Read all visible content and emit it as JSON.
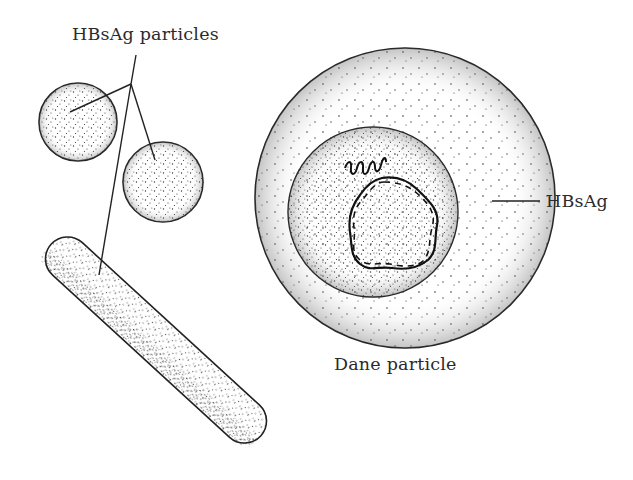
{
  "figure": {
    "type": "schematic illustration",
    "labels": {
      "hbsag_particles": "HBsAg particles",
      "hbsag": "HBsAg",
      "dane_particle": "Dane particle"
    },
    "elements": [
      {
        "name": "spherical-hbsag-particle",
        "shape": "circle",
        "count": 2
      },
      {
        "name": "filamentous-hbsag-particle",
        "shape": "rod",
        "count": 1
      },
      {
        "name": "dane-particle",
        "shape": "concentric circles",
        "components": [
          "outer envelope (HBsAg)",
          "inner core",
          "circular DNA",
          "coiled polymerase"
        ]
      }
    ],
    "colors": {
      "ink": "#2b2b2b",
      "background": "#ffffff"
    }
  }
}
